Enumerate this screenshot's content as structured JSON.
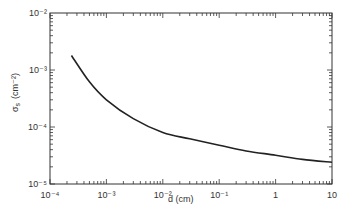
{
  "chart_data": {
    "type": "line",
    "title": "",
    "xlabel": "d (cm)",
    "ylabel": "σs (cm⁻²)",
    "xscale": "log",
    "yscale": "log",
    "xlim": [
      0.0001,
      10
    ],
    "ylim": [
      1e-05,
      0.01
    ],
    "grid": false,
    "legend": null,
    "x_ticks": [
      "10⁻⁴",
      "10⁻³",
      "10⁻²",
      "10⁻¹",
      "1",
      "10"
    ],
    "y_ticks": [
      "10⁻⁵",
      "10⁻⁴",
      "10⁻³",
      "10⁻²"
    ],
    "series": [
      {
        "name": "σs",
        "x": [
          0.00024,
          0.0005,
          0.001,
          0.003,
          0.01,
          0.03,
          0.1,
          0.3,
          1,
          3,
          10
        ],
        "y": [
          0.0018,
          0.00062,
          0.0003,
          0.00014,
          8e-05,
          6.2e-05,
          4.8e-05,
          3.8e-05,
          3.2e-05,
          2.7e-05,
          2.4e-05
        ]
      }
    ]
  },
  "labels": {
    "xlabel": "d (cm)",
    "ylabel_sigma": "σ",
    "ylabel_sub": "s",
    "ylabel_unit": "(cm⁻²)",
    "x_tick_labels": [
      "10⁻⁴",
      "10⁻³",
      "10⁻²",
      "10⁻¹",
      "1",
      "10"
    ],
    "y_tick_labels": [
      "10⁻⁵",
      "10⁻⁴",
      "10⁻³",
      "10⁻²"
    ]
  }
}
